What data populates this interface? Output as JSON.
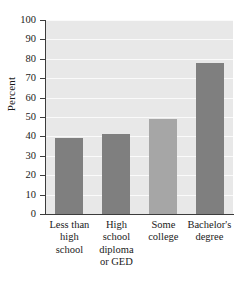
{
  "chart_data": {
    "type": "bar",
    "title": "",
    "xlabel": "",
    "ylabel": "Percent",
    "categories": [
      "Less than high school",
      "High school diploma or GED",
      "Some college",
      "Bachelor's degree"
    ],
    "category_lines": [
      [
        "Less than",
        "high",
        "school"
      ],
      [
        "High",
        "school",
        "diploma",
        "or GED"
      ],
      [
        "Some",
        "college"
      ],
      [
        "Bachelor's",
        "degree"
      ]
    ],
    "values": [
      39,
      41,
      49,
      78
    ],
    "bar_colors": [
      "#7f7f7f",
      "#7f7f7f",
      "#a6a6a6",
      "#7f7f7f"
    ],
    "ylim": [
      0,
      100
    ],
    "ytick_labels": [
      "0",
      "10",
      "20",
      "30",
      "40",
      "50",
      "60",
      "70",
      "80",
      "90",
      "100"
    ],
    "ytick_values": [
      0,
      10,
      20,
      30,
      40,
      50,
      60,
      70,
      80,
      90,
      100
    ],
    "grid": true,
    "grid_color": "#fafafa",
    "plot_background": "#e8e8e8",
    "axis_color": "#3c3c3c",
    "legend": null
  }
}
